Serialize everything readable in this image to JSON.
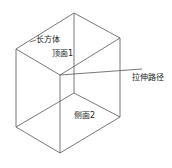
{
  "diagram": {
    "type": "wireframe-cuboid",
    "stroke_color": "#555555",
    "labels": {
      "cuboid": "长方体",
      "top_face": "顶面1",
      "extrude_path": "拉伸路径",
      "side_face": "侧面2"
    }
  }
}
